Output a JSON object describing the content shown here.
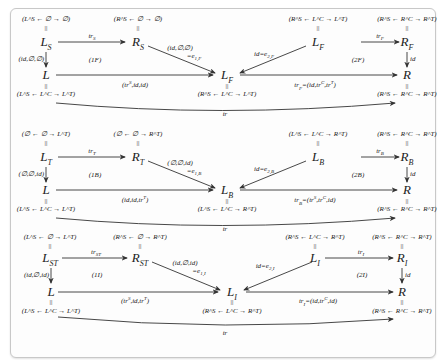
{
  "diagram": {
    "panels": [
      {
        "id": "F",
        "nodes": {
          "LX": {
            "label": "L_S",
            "tuple": "(L^S ← ∅ → ∅)"
          },
          "RX": {
            "label": "R_S",
            "tuple": "(R^S ← ∅ → ∅)"
          },
          "LYm": {
            "label": "L_F",
            "tuple": "(R^S ← L^C → L^T)"
          },
          "LYt": {
            "label": "L_F",
            "tuple": "(R^S ← L^C → L^T)"
          },
          "RY": {
            "label": "R_F",
            "tuple": "(R^S ← R^C → R^T)"
          },
          "L": {
            "label": "L",
            "tuple": "(L^S ← L^C → L^T)"
          },
          "R": {
            "label": "R",
            "tuple": "(R^S ← R^C → R^T)"
          }
        },
        "edges": {
          "top_left": "tr_S",
          "top_right": "tr_F",
          "left_down": "(id,∅,∅)",
          "right_down": "id",
          "diag_left": "(id,∅,∅) =e_{1,F}",
          "diag_left_a": "(id,∅,∅)",
          "diag_left_b": "=e_{1,F}",
          "diag_right": "id=e_{2,F}",
          "bottom_left": "(tr^S,id,id)",
          "bottom_right": "tr_F=(id,tr^C,tr^T)",
          "curve": "tr"
        },
        "cells": {
          "left": "(1F)",
          "right": "(2F)"
        }
      },
      {
        "id": "B",
        "nodes": {
          "LX": {
            "label": "L_T",
            "tuple": "(∅ ← ∅ → L^T)"
          },
          "RX": {
            "label": "R_T",
            "tuple": "(∅ ← ∅ → R^T)"
          },
          "LYm": {
            "label": "L_B",
            "tuple": "(L^S ← L^C → R^T)"
          },
          "LYt": {
            "label": "L_B",
            "tuple": "(L^S ← L^C → R^T)"
          },
          "RY": {
            "label": "R_B",
            "tuple": "(R^S ← R^C → R^T)"
          },
          "L": {
            "label": "L",
            "tuple": "(L^S ← L^C → L^T)"
          },
          "R": {
            "label": "R",
            "tuple": "(R^S ← R^C → R^T)"
          }
        },
        "edges": {
          "top_left": "tr_T",
          "top_right": "tr_B",
          "left_down": "(∅,∅,id)",
          "right_down": "id",
          "diag_left_a": "(∅,∅,id)",
          "diag_left_b": "=e_{1,B}",
          "diag_right": "id=e_{2,B}",
          "bottom_left": "(id,id,tr^T)",
          "bottom_right": "tr_B=(tr^S,tr^C,id)",
          "curve": "tr"
        },
        "cells": {
          "left": "(1B)",
          "right": "(2B)"
        }
      },
      {
        "id": "I",
        "nodes": {
          "LX": {
            "label": "L_ST",
            "tuple": "(L^S ← ∅ → L^T)"
          },
          "RX": {
            "label": "R_ST",
            "tuple": "(R^S ← ∅ → R^T)"
          },
          "LYm": {
            "label": "L_I",
            "tuple": "(R^S ← L^C → R^T)"
          },
          "LYt": {
            "label": "L_I",
            "tuple": "(R^S ← L^C → R^T)"
          },
          "RY": {
            "label": "R_I",
            "tuple": "(R^S ← R^C → R^T)"
          },
          "L": {
            "label": "L",
            "tuple": "(L^S ← L^C → L^T)"
          },
          "R": {
            "label": "R",
            "tuple": "(R^S ← R^C → R^T)"
          }
        },
        "edges": {
          "top_left": "tr_ST",
          "top_right": "tr_I",
          "left_down": "(id,∅,id)",
          "right_down": "id",
          "diag_left_a": "(id,∅,id)",
          "diag_left_b": "=e_{1,I}",
          "diag_right": "id=e_{2,I}",
          "bottom_left": "(tr^S,id,tr^T)",
          "bottom_right": "tr_I=(id,tr^C,id)",
          "curve": "tr"
        },
        "cells": {
          "left": "(1I)",
          "right": "(2I)"
        }
      }
    ],
    "equals_sign": "||",
    "colors": {
      "line": "#333333",
      "text": "#222222",
      "frame_border": "#c8c8c8",
      "background": "#fdfdfd"
    }
  }
}
